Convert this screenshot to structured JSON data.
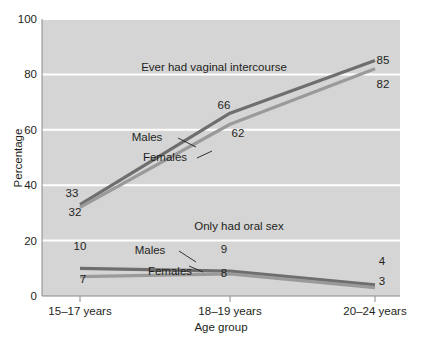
{
  "chart_data": {
    "type": "line",
    "title": "",
    "xlabel": "Age group",
    "ylabel": "Percentage",
    "categories": [
      "15–17 years",
      "18–19 years",
      "20–24 years"
    ],
    "ylim": [
      0,
      100
    ],
    "yticks": [
      0,
      20,
      40,
      60,
      80,
      100
    ],
    "ytick_labels": [
      "0",
      "20",
      "40",
      "60",
      "80",
      "100"
    ],
    "grid": true,
    "legend": "inline-annotations",
    "groups": [
      {
        "name": "Ever had vaginal intercourse",
        "series": [
          {
            "name": "Males",
            "values": [
              33,
              66,
              85
            ],
            "color": "#6e6e6e"
          },
          {
            "name": "Females",
            "values": [
              32,
              62,
              82
            ],
            "color": "#9a9a9a"
          }
        ]
      },
      {
        "name": "Only had oral sex",
        "series": [
          {
            "name": "Males",
            "values": [
              10,
              9,
              4
            ],
            "color": "#6e6e6e"
          },
          {
            "name": "Females",
            "values": [
              7,
              8,
              3
            ],
            "color": "#9a9a9a"
          }
        ]
      }
    ],
    "annotations": [
      {
        "text": "Ever had vaginal intercourse",
        "x": 214,
        "y": 71
      },
      {
        "text": "Only had oral sex",
        "x": 239,
        "y": 230
      },
      {
        "text": "Males",
        "x": 147,
        "y": 141
      },
      {
        "text": "Females",
        "x": 165,
        "y": 161
      },
      {
        "text": "Males",
        "x": 150,
        "y": 254
      },
      {
        "text": "Females",
        "x": 170,
        "y": 275
      }
    ],
    "point_labels": [
      {
        "text": "33",
        "x": 72,
        "y": 197
      },
      {
        "text": "32",
        "x": 75,
        "y": 216
      },
      {
        "text": "66",
        "x": 224,
        "y": 109
      },
      {
        "text": "62",
        "x": 238,
        "y": 137
      },
      {
        "text": "85",
        "x": 383,
        "y": 64
      },
      {
        "text": "82",
        "x": 383,
        "y": 88
      },
      {
        "text": "10",
        "x": 80,
        "y": 250
      },
      {
        "text": "7",
        "x": 83,
        "y": 283
      },
      {
        "text": "9",
        "x": 224,
        "y": 253
      },
      {
        "text": "8",
        "x": 224,
        "y": 277
      },
      {
        "text": "4",
        "x": 382,
        "y": 265
      },
      {
        "text": "3",
        "x": 382,
        "y": 285
      }
    ],
    "colors": {
      "plot_background": "#d5d5d5",
      "gridline": "#ffffff",
      "axis": "#8a8a8a",
      "text": "#231f20",
      "males_line": "#6e6e6e",
      "females_line": "#9c9c9c"
    }
  }
}
